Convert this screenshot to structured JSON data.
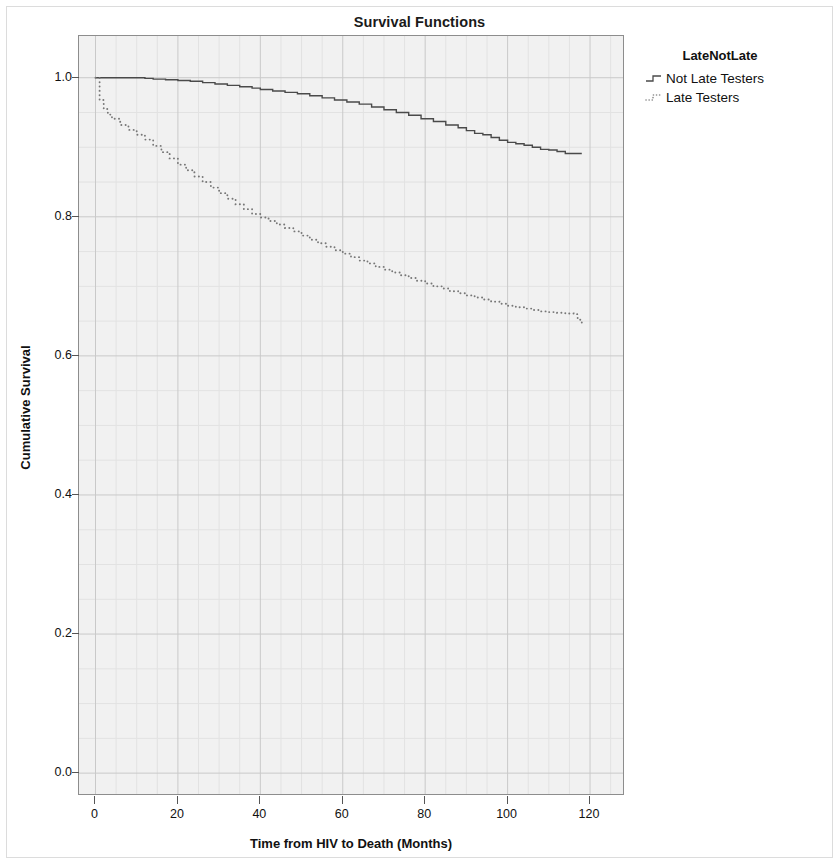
{
  "chart_data": {
    "type": "line",
    "title": "Survival Functions",
    "xlabel": "Time from HIV to Death (Months)",
    "ylabel": "Cumulative Survival",
    "xlim": [
      -4,
      128
    ],
    "ylim": [
      -0.03,
      1.06
    ],
    "xticks": [
      0,
      20,
      40,
      60,
      80,
      100,
      120
    ],
    "xtick_labels": [
      "0",
      "20",
      "40",
      "60",
      "80",
      "100",
      "120"
    ],
    "yticks": [
      0.0,
      0.2,
      0.4,
      0.6,
      0.8,
      1.0
    ],
    "ytick_labels": [
      "0.0",
      "0.2",
      "0.4",
      "0.6",
      "0.8",
      "1.0"
    ],
    "grid": true,
    "minor_grid": true,
    "legend_position": "right",
    "legend_title": "LateNotLate",
    "plot_background": "#f1f1f1",
    "grid_color": "#c9c9c9",
    "frame_color": "#8d8d8d",
    "series": [
      {
        "name": "Not Late Testers",
        "style": "solid",
        "color": "#4a4a4a",
        "x": [
          0,
          1,
          4,
          8,
          12,
          14,
          17,
          20,
          23,
          26,
          29,
          32,
          35,
          38,
          40,
          43,
          46,
          49,
          52,
          55,
          58,
          61,
          64,
          67,
          70,
          73,
          76,
          79,
          82,
          85,
          88,
          90,
          92,
          94,
          96,
          98,
          100,
          102,
          104,
          106,
          108,
          110,
          112,
          114,
          116,
          118
        ],
        "y": [
          1.0,
          1.0,
          1.0,
          1.0,
          0.999,
          0.998,
          0.997,
          0.996,
          0.995,
          0.993,
          0.991,
          0.989,
          0.987,
          0.985,
          0.983,
          0.981,
          0.979,
          0.977,
          0.974,
          0.971,
          0.968,
          0.965,
          0.962,
          0.958,
          0.954,
          0.95,
          0.946,
          0.941,
          0.937,
          0.932,
          0.928,
          0.924,
          0.92,
          0.918,
          0.914,
          0.91,
          0.907,
          0.905,
          0.903,
          0.9,
          0.897,
          0.896,
          0.894,
          0.891,
          0.891,
          0.891
        ]
      },
      {
        "name": "Late Testers",
        "style": "dotted",
        "color": "#777777",
        "x": [
          0,
          1,
          2,
          3,
          4,
          6,
          8,
          10,
          12,
          14,
          16,
          18,
          20,
          22,
          24,
          26,
          28,
          30,
          32,
          34,
          36,
          38,
          40,
          42,
          44,
          46,
          48,
          50,
          52,
          54,
          56,
          58,
          60,
          62,
          64,
          66,
          68,
          70,
          72,
          74,
          76,
          78,
          80,
          82,
          84,
          86,
          88,
          90,
          92,
          94,
          96,
          98,
          100,
          102,
          104,
          106,
          108,
          110,
          112,
          114,
          116,
          117,
          118
        ],
        "y": [
          1.0,
          0.968,
          0.955,
          0.947,
          0.941,
          0.932,
          0.925,
          0.918,
          0.911,
          0.902,
          0.893,
          0.884,
          0.875,
          0.867,
          0.858,
          0.85,
          0.842,
          0.834,
          0.826,
          0.818,
          0.811,
          0.804,
          0.799,
          0.794,
          0.789,
          0.784,
          0.779,
          0.773,
          0.767,
          0.762,
          0.757,
          0.752,
          0.747,
          0.742,
          0.737,
          0.733,
          0.728,
          0.724,
          0.72,
          0.716,
          0.712,
          0.708,
          0.704,
          0.7,
          0.697,
          0.693,
          0.69,
          0.687,
          0.684,
          0.681,
          0.678,
          0.675,
          0.672,
          0.67,
          0.668,
          0.666,
          0.664,
          0.663,
          0.662,
          0.661,
          0.66,
          0.652,
          0.645
        ]
      }
    ]
  },
  "legend": {
    "title": "LateNotLate",
    "entries": [
      {
        "label": "Not Late Testers",
        "style": "solid"
      },
      {
        "label": "Late Testers",
        "style": "dotted"
      }
    ]
  }
}
